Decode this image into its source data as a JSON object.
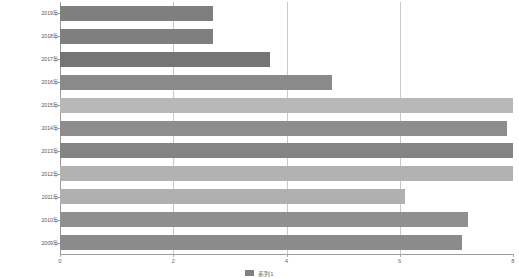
{
  "chart_data": {
    "type": "bar",
    "orientation": "horizontal",
    "title": "",
    "xlabel": "",
    "ylabel": "",
    "xlim": [
      0,
      8
    ],
    "ylim": null,
    "grid": true,
    "gridlines_x": [
      2,
      4,
      6
    ],
    "xticks": [
      "0",
      "2",
      "4",
      "6",
      "8"
    ],
    "xtick_values": [
      0,
      2,
      4,
      6,
      8
    ],
    "legend_position": "bottom-center",
    "categories": [
      "2019年",
      "2018年",
      "2017年",
      "2016年",
      "2015年",
      "2014年",
      "2013年",
      "2012年",
      "2011年",
      "2010年",
      "2009年"
    ],
    "values": [
      2.7,
      2.7,
      3.7,
      4.8,
      8.0,
      7.9,
      8.0,
      8.0,
      6.1,
      7.2,
      7.1
    ],
    "bar_colors": [
      "#7f7f7f",
      "#7f7f7f",
      "#757575",
      "#8a8a8a",
      "#b8b8b8",
      "#8d8d8d",
      "#848484",
      "#b2b2b2",
      "#b0b0b0",
      "#8f8f8f",
      "#8b8b8b"
    ],
    "series": [
      {
        "name": "系列1",
        "values": [
          2.7,
          2.7,
          3.7,
          4.8,
          8.0,
          7.9,
          8.0,
          8.0,
          6.1,
          7.2,
          7.1
        ]
      }
    ],
    "legend": [
      {
        "label": "系列1",
        "color": "#808080"
      }
    ]
  },
  "axis": {
    "x_tick_labels": [
      "0",
      "2",
      "4",
      "6",
      "8"
    ],
    "y_tick_labels": [
      "2019年",
      "2018年",
      "2017年",
      "2016年",
      "2015年",
      "2014年",
      "2013年",
      "2012年",
      "2011年",
      "2010年",
      "2009年"
    ]
  },
  "colors": {
    "bar_dark": "#7f7f7f",
    "bar_light": "#b8b8b8",
    "gridline": "#c9c9c9",
    "axis": "#9a9a9a",
    "tick_text": "#6a6a6a",
    "background": "#ffffff"
  }
}
